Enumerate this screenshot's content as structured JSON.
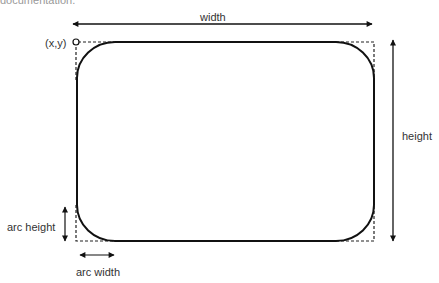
{
  "diagram": {
    "type": "rounded-rectangle-parameters",
    "clipped_text": "documentation.",
    "labels": {
      "width": "width",
      "height": "height",
      "origin": "(x,y)",
      "arc_height": "arc height",
      "arc_width": "arc width"
    },
    "geometry": {
      "x": 76,
      "y": 42,
      "width": 298,
      "height": 199,
      "arc_width": 38,
      "arc_height": 36
    },
    "colors": {
      "stroke": "#111111",
      "dashed": "#222222",
      "text": "#333333"
    }
  }
}
